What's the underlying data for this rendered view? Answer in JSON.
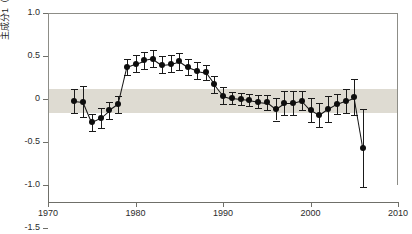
{
  "chart_data": {
    "type": "line",
    "title": "",
    "xlabel": "",
    "ylabel": "主成分1（葉のサイズ）",
    "xlim": [
      1970,
      2010
    ],
    "ylim": [
      -1.5,
      1.0
    ],
    "xticks": [
      1970,
      1980,
      1990,
      2000,
      2010
    ],
    "xticklabels": [
      "1970",
      "1980",
      "1990",
      "2000",
      "2010"
    ],
    "yticks": [
      1.0,
      0.5,
      0,
      -0.5,
      -1.0,
      -1.5
    ],
    "yticklabels": [
      "1.0",
      "0.5",
      "0",
      "-0.5",
      "-1.0",
      "-1.5"
    ],
    "grid": false,
    "legend": null,
    "shaded_band": {
      "label": "",
      "ymin": -0.16,
      "ymax": 0.12,
      "color": "#dedbd2"
    },
    "marker_color": "#0d0d0d",
    "line_color": "#111111",
    "errorbar_color": "#1a1a1a",
    "x": [
      1973,
      1974,
      1975,
      1976,
      1977,
      1978,
      1979,
      1980,
      1981,
      1982,
      1983,
      1984,
      1985,
      1986,
      1987,
      1988,
      1989,
      1990,
      1991,
      1992,
      1993,
      1994,
      1995,
      1996,
      1997,
      1998,
      1999,
      2000,
      2001,
      2002,
      2003,
      2004,
      2005,
      2006
    ],
    "y": [
      -0.02,
      -0.03,
      -0.27,
      -0.22,
      -0.13,
      -0.06,
      0.37,
      0.41,
      0.45,
      0.47,
      0.4,
      0.41,
      0.44,
      0.37,
      0.33,
      0.31,
      0.17,
      0.04,
      0.01,
      0.0,
      -0.01,
      -0.03,
      -0.04,
      -0.12,
      -0.05,
      -0.05,
      -0.02,
      -0.13,
      -0.19,
      -0.12,
      -0.06,
      -0.02,
      0.02,
      -0.57
    ],
    "yerr_lower": [
      0.14,
      0.18,
      0.1,
      0.12,
      0.1,
      0.1,
      0.09,
      0.1,
      0.1,
      0.1,
      0.1,
      0.1,
      0.1,
      0.09,
      0.1,
      0.09,
      0.1,
      0.1,
      0.07,
      0.07,
      0.07,
      0.08,
      0.09,
      0.13,
      0.14,
      0.14,
      0.11,
      0.14,
      0.14,
      0.15,
      0.12,
      0.14,
      0.21,
      0.45
    ],
    "yerr_upper": [
      0.14,
      0.18,
      0.1,
      0.12,
      0.1,
      0.1,
      0.09,
      0.1,
      0.1,
      0.1,
      0.1,
      0.1,
      0.1,
      0.09,
      0.1,
      0.09,
      0.1,
      0.1,
      0.07,
      0.07,
      0.07,
      0.08,
      0.09,
      0.13,
      0.14,
      0.14,
      0.11,
      0.14,
      0.14,
      0.15,
      0.12,
      0.14,
      0.21,
      0.45
    ]
  }
}
